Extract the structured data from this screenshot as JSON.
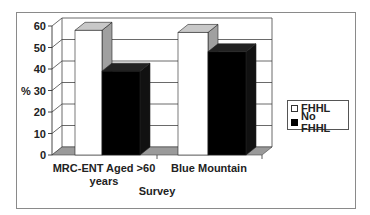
{
  "chart_data": {
    "type": "bar",
    "style": "3d-clustered-column",
    "title": "",
    "xlabel": "Survey",
    "ylabel": "%",
    "ylim": [
      0,
      60
    ],
    "yticks": [
      0,
      10,
      20,
      30,
      40,
      50,
      60
    ],
    "grid": true,
    "legend_position": "right",
    "categories": [
      "MRC-ENT Aged >60 years",
      "Blue Mountain"
    ],
    "category_lines": [
      [
        "MRC-ENT Aged >60",
        "years"
      ],
      [
        "Blue Mountain"
      ]
    ],
    "series": [
      {
        "name": "FHHL",
        "color": "#ffffff",
        "values": [
          58,
          57
        ]
      },
      {
        "name": "No FHHL",
        "color": "#000000",
        "values": [
          39,
          48
        ]
      }
    ]
  },
  "legend": {
    "items": [
      {
        "label": "FHHL",
        "color": "#ffffff"
      },
      {
        "label": "No FHHL",
        "color": "#000000"
      }
    ]
  },
  "colors": {
    "frame": "#8a8a8a",
    "grid": "#444444",
    "floor": "#9a9a9a",
    "bar_side": "#a0a0a0",
    "bar_top": "#c8c8c8"
  }
}
